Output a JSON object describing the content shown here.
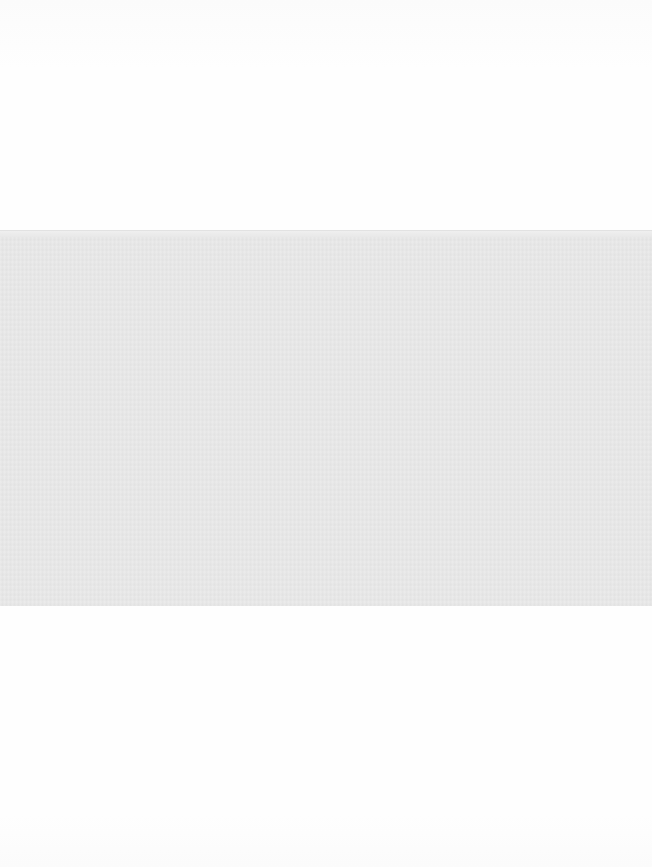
{
  "document": {
    "type": "scanned-page",
    "colors": {
      "paper": "#fdfdfd",
      "block_fill": "#e9e9e9"
    },
    "regions": [
      {
        "name": "top-margin",
        "content": ""
      },
      {
        "name": "gray-block",
        "content": ""
      },
      {
        "name": "bottom-margin",
        "content": ""
      }
    ]
  }
}
